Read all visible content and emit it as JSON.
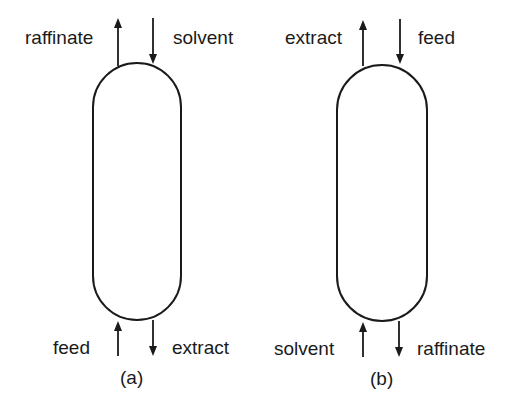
{
  "diagram": {
    "panels": [
      {
        "id": "a",
        "caption": "(a)",
        "top_left_label": "raffinate",
        "top_right_label": "solvent",
        "bottom_left_label": "feed",
        "bottom_right_label": "extract"
      },
      {
        "id": "b",
        "caption": "(b)",
        "top_left_label": "extract",
        "top_right_label": "feed",
        "bottom_left_label": "solvent",
        "bottom_right_label": "raffinate"
      }
    ],
    "colors": {
      "stroke": "#1a1a1a",
      "background": "#ffffff"
    }
  }
}
